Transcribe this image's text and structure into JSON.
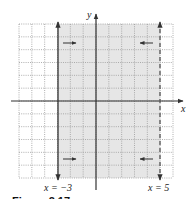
{
  "chart_data": {
    "type": "region",
    "title": "",
    "xlabel": "x",
    "ylabel": "y",
    "xlim": [
      -6,
      6
    ],
    "ylim": [
      -6,
      6
    ],
    "grid": true,
    "grid_step": 1,
    "boundaries": [
      {
        "equation": "x = -3",
        "x": -3,
        "style": "solid",
        "included": true,
        "label": "x = −3"
      },
      {
        "equation": "x = 5",
        "x": 5,
        "style": "dashed",
        "included": false,
        "label": "x = 5"
      }
    ],
    "shaded_region": {
      "description": "-3 ≤ x < 5",
      "x_from": -3,
      "x_to": 5
    },
    "arrows": [
      {
        "position": "upper-left",
        "direction": "right"
      },
      {
        "position": "upper-right",
        "direction": "left"
      },
      {
        "position": "lower-left",
        "direction": "right"
      },
      {
        "position": "lower-right",
        "direction": "left"
      }
    ],
    "colors": {
      "shade": "#e6e6e6",
      "grid": "#9a9a9a",
      "axis": "#333333"
    }
  },
  "labels": {
    "y_axis": "y",
    "x_axis": "x",
    "left_line": "x = −3",
    "right_line": "x = 5",
    "caption": "Figure 2.17"
  }
}
